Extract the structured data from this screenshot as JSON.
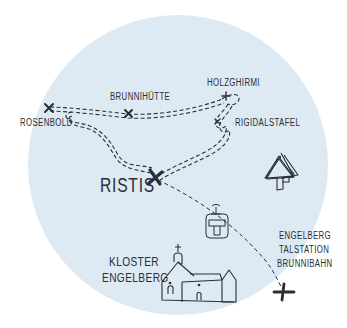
{
  "map": {
    "background_color": "#dde9f3",
    "ink_color": "#2a2e35",
    "places": {
      "holzghirmi": "HOLZGHIRMI",
      "brunnihuette": "BRUNNIHÜTTE",
      "rosenbold": "ROSENBOLD",
      "rigidalstafel": "RIGIDALSTAFEL",
      "ristis": "RISTIS",
      "kloster_line1": "KLOSTER",
      "kloster_line2": "ENGELBERG",
      "talstation_line1": "ENGELBERG",
      "talstation_line2": "TALSTATION",
      "talstation_line3": "BRUNNIBAHN"
    },
    "icons": [
      "trees-icon",
      "cable-car-icon",
      "monastery-icon",
      "waypoint-x-icon"
    ]
  }
}
